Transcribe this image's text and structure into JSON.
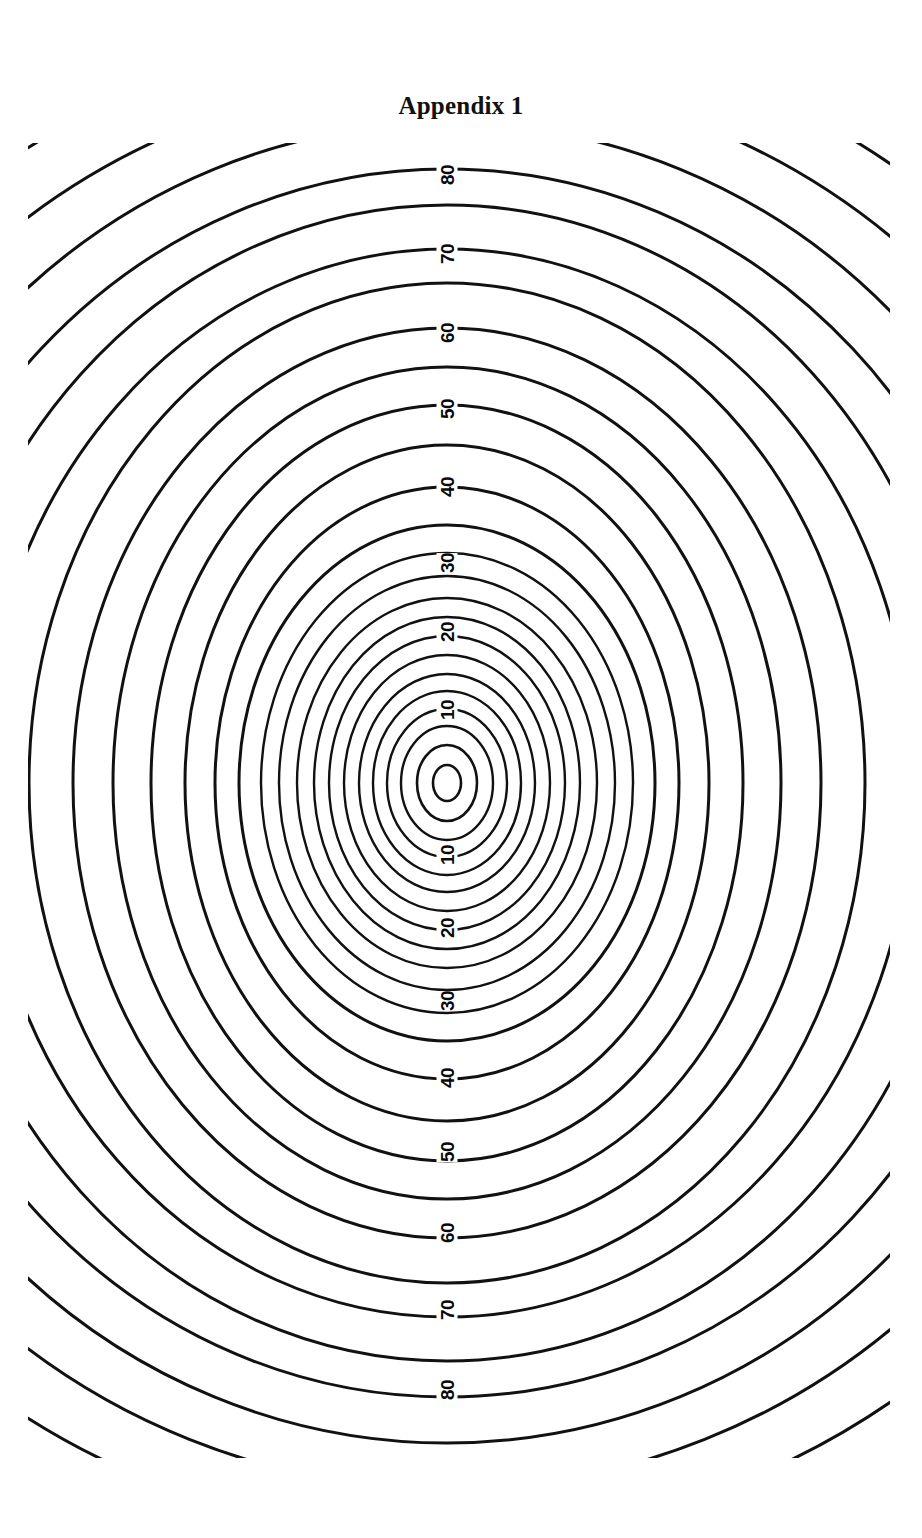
{
  "document": {
    "title": "Appendix 1",
    "page_background": "#ffffff",
    "ink_color": "#111111"
  },
  "figure": {
    "name": "concentric-contour-map",
    "line_color": "#111111"
  },
  "chart_data": {
    "type": "line",
    "title": "Appendix 1",
    "subtype": "contour",
    "xlabel": "",
    "ylabel": "",
    "grid": false,
    "legend": false,
    "contour_interval": 5,
    "center": {
      "x": 447,
      "y": 783
    },
    "labeled_levels_above_center": [
      10,
      20,
      30,
      40,
      50,
      60,
      70,
      80
    ],
    "labeled_levels_below_center": [
      10,
      20,
      30,
      40,
      50,
      60,
      70,
      80
    ],
    "labels": [
      {
        "text": "80",
        "x": 447,
        "y": 175,
        "rotation": -90
      },
      {
        "text": "70",
        "x": 447,
        "y": 254,
        "rotation": -90
      },
      {
        "text": "60",
        "x": 447,
        "y": 333,
        "rotation": -90
      },
      {
        "text": "50",
        "x": 447,
        "y": 409,
        "rotation": -90
      },
      {
        "text": "40",
        "x": 447,
        "y": 487,
        "rotation": -90
      },
      {
        "text": "30",
        "x": 447,
        "y": 563,
        "rotation": -90
      },
      {
        "text": "20",
        "x": 447,
        "y": 632,
        "rotation": -90
      },
      {
        "text": "10",
        "x": 447,
        "y": 710,
        "rotation": -90
      },
      {
        "text": "10",
        "x": 447,
        "y": 855,
        "rotation": -90
      },
      {
        "text": "20",
        "x": 447,
        "y": 928,
        "rotation": -90
      },
      {
        "text": "30",
        "x": 447,
        "y": 1001,
        "rotation": -90
      },
      {
        "text": "40",
        "x": 447,
        "y": 1078,
        "rotation": -90
      },
      {
        "text": "50",
        "x": 447,
        "y": 1152,
        "rotation": -90
      },
      {
        "text": "60",
        "x": 447,
        "y": 1233,
        "rotation": -90
      },
      {
        "text": "70",
        "x": 447,
        "y": 1310,
        "rotation": -90
      },
      {
        "text": "80",
        "x": 447,
        "y": 1390,
        "rotation": -90
      }
    ],
    "rings": [
      {
        "level": 5,
        "rx": 14,
        "ry": 18,
        "labeled": false
      },
      {
        "level": 10,
        "rx": 30,
        "ry": 38,
        "labeled": false
      },
      {
        "level": 15,
        "rx": 46,
        "ry": 57,
        "labeled": false
      },
      {
        "level": 20,
        "rx": 60,
        "ry": 74,
        "labeled": false
      },
      {
        "level": 25,
        "rx": 74,
        "ry": 92,
        "labeled": false
      },
      {
        "level": 30,
        "rx": 88,
        "ry": 109,
        "labeled": true,
        "label": "10"
      },
      {
        "level": 35,
        "rx": 103,
        "ry": 128,
        "labeled": false
      },
      {
        "level": 40,
        "rx": 118,
        "ry": 147,
        "labeled": false
      },
      {
        "level": 45,
        "rx": 133,
        "ry": 166,
        "labeled": false
      },
      {
        "level": 50,
        "rx": 150,
        "ry": 185,
        "labeled": true,
        "label": "20"
      },
      {
        "level": 55,
        "rx": 168,
        "ry": 207,
        "labeled": false
      },
      {
        "level": 60,
        "rx": 186,
        "ry": 230,
        "labeled": true,
        "label": "30"
      },
      {
        "level": 65,
        "rx": 208,
        "ry": 258,
        "labeled": false
      },
      {
        "level": 70,
        "rx": 232,
        "ry": 296,
        "labeled": true,
        "label": "40"
      },
      {
        "level": 75,
        "rx": 262,
        "ry": 338,
        "labeled": false
      },
      {
        "level": 80,
        "rx": 296,
        "ry": 378,
        "labeled": true,
        "label": "50"
      },
      {
        "level": 85,
        "rx": 334,
        "ry": 416,
        "labeled": false
      },
      {
        "level": 90,
        "rx": 374,
        "ry": 455,
        "labeled": true,
        "label": "60"
      },
      {
        "level": 95,
        "rx": 418,
        "ry": 500,
        "labeled": false
      },
      {
        "level": 100,
        "rx": 466,
        "ry": 534,
        "labeled": true,
        "label": "70"
      },
      {
        "level": 105,
        "rx": 518,
        "ry": 578,
        "labeled": false
      },
      {
        "level": 110,
        "rx": 574,
        "ry": 614,
        "labeled": true,
        "label": "80"
      },
      {
        "level": 115,
        "rx": 634,
        "ry": 660,
        "labeled": false
      },
      {
        "level": 120,
        "rx": 700,
        "ry": 706,
        "labeled": false
      },
      {
        "level": 125,
        "rx": 772,
        "ry": 756,
        "labeled": false
      },
      {
        "level": 130,
        "rx": 848,
        "ry": 808,
        "labeled": false
      },
      {
        "level": 135,
        "rx": 930,
        "ry": 862,
        "labeled": false
      },
      {
        "level": 140,
        "rx": 1016,
        "ry": 920,
        "labeled": false
      }
    ]
  }
}
